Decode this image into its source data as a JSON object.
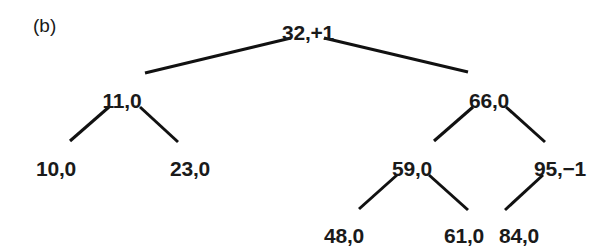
{
  "figure": {
    "panel_label": "(b)",
    "panel_label_x": 33,
    "panel_label_y": 16,
    "background_color": "#ffffff",
    "ink_color": "#1a1a1a",
    "edge_color": "#111111",
    "edge_width": 3
  },
  "chart_data": {
    "type": "diagram",
    "diagram_kind": "avl-binary-search-tree",
    "title": "(b)",
    "node_label_format": "key,balance-factor",
    "nodes": [
      {
        "id": "n32",
        "key": "32",
        "balance": "+1",
        "label": "32,+1",
        "x": 308,
        "y": 22,
        "depth": 0
      },
      {
        "id": "n11",
        "key": "11",
        "balance": "0",
        "label": "11,0",
        "x": 122,
        "y": 90,
        "depth": 1
      },
      {
        "id": "n66",
        "key": "66",
        "balance": "0",
        "label": "66,0",
        "x": 489,
        "y": 90,
        "depth": 1
      },
      {
        "id": "n10",
        "key": "10",
        "balance": "0",
        "label": "10,0",
        "x": 56,
        "y": 158,
        "depth": 2
      },
      {
        "id": "n23",
        "key": "23",
        "balance": "0",
        "label": "23,0",
        "x": 190,
        "y": 158,
        "depth": 2
      },
      {
        "id": "n59",
        "key": "59",
        "balance": "0",
        "label": "59,0",
        "x": 412,
        "y": 158,
        "depth": 2
      },
      {
        "id": "n95",
        "key": "95",
        "balance": "-1",
        "label": "95,−1",
        "x": 560,
        "y": 158,
        "depth": 2
      },
      {
        "id": "n48",
        "key": "48",
        "balance": "0",
        "label": "48,0",
        "x": 344,
        "y": 225,
        "depth": 3
      },
      {
        "id": "n61",
        "key": "61",
        "balance": "0",
        "label": "61,0",
        "x": 464,
        "y": 225,
        "depth": 3
      },
      {
        "id": "n84",
        "key": "84",
        "balance": "0",
        "label": "84,0",
        "x": 519,
        "y": 225,
        "depth": 3
      }
    ],
    "edges": [
      {
        "from": "n32",
        "to": "n11",
        "side": "left",
        "x1": 291,
        "y1": 38,
        "x2": 145,
        "y2": 73
      },
      {
        "from": "n32",
        "to": "n66",
        "side": "right",
        "x1": 324,
        "y1": 38,
        "x2": 468,
        "y2": 72
      },
      {
        "from": "n11",
        "to": "n10",
        "side": "left",
        "x1": 109,
        "y1": 107,
        "x2": 70,
        "y2": 141
      },
      {
        "from": "n11",
        "to": "n23",
        "side": "right",
        "x1": 140,
        "y1": 107,
        "x2": 178,
        "y2": 142
      },
      {
        "from": "n66",
        "to": "n59",
        "side": "left",
        "x1": 473,
        "y1": 107,
        "x2": 434,
        "y2": 141
      },
      {
        "from": "n66",
        "to": "n95",
        "side": "right",
        "x1": 506,
        "y1": 107,
        "x2": 545,
        "y2": 142
      },
      {
        "from": "n59",
        "to": "n48",
        "side": "left",
        "x1": 397,
        "y1": 175,
        "x2": 359,
        "y2": 209
      },
      {
        "from": "n59",
        "to": "n61",
        "side": "right",
        "x1": 429,
        "y1": 175,
        "x2": 468,
        "y2": 210
      },
      {
        "from": "n95",
        "to": "n84",
        "side": "left",
        "x1": 543,
        "y1": 175,
        "x2": 505,
        "y2": 210
      }
    ]
  }
}
